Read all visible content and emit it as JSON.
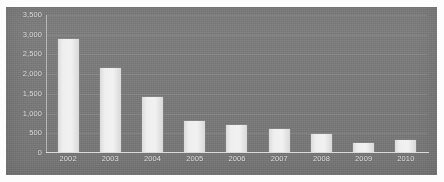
{
  "chart_data": {
    "type": "bar",
    "title": "",
    "subtitle": "",
    "xlabel": "",
    "ylabel": "",
    "categories": [
      "2002",
      "2003",
      "2004",
      "2005",
      "2006",
      "2007",
      "2008",
      "2009",
      "2010"
    ],
    "values": [
      2900,
      2150,
      1400,
      800,
      700,
      600,
      450,
      230,
      300
    ],
    "series": [
      {
        "name": "",
        "values": [
          2900,
          2150,
          1400,
          800,
          700,
          600,
          450,
          230,
          300
        ]
      }
    ],
    "ylim": [
      0,
      3500
    ],
    "ytick_values": [
      0,
      500,
      1000,
      1500,
      2000,
      2500,
      3000,
      3500
    ],
    "ytick_labels": [
      "0",
      "500",
      "1,000",
      "1,500",
      "2,000",
      "2,500",
      "3,000",
      "3,500"
    ],
    "xtick_labels": [
      "2002",
      "2003",
      "2004",
      "2005",
      "2006",
      "2007",
      "2008",
      "2009",
      "2010"
    ],
    "grid": true,
    "grid_axis": "y",
    "legend": false,
    "legend_position": "none",
    "annotations": [],
    "colors": {
      "plot_background": "#7a7a7a",
      "page_background": "#fdfdfd",
      "bar_fill": "#eeeeee",
      "bar_edge": "#d9d9d9",
      "axis_line": "#ebebeb",
      "gridline": "#8f8f8f",
      "tick_label": "#e8e8e8"
    }
  }
}
